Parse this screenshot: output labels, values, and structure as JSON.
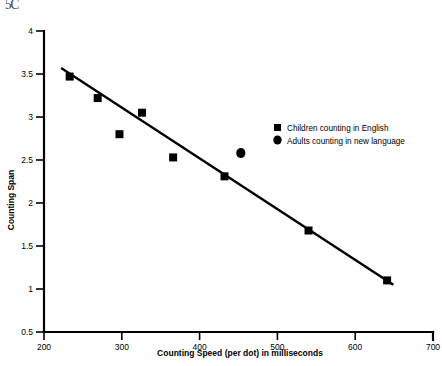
{
  "artifact": {
    "top_left_text": "5C",
    "top_left_sub": "."
  },
  "chart_data": {
    "type": "scatter",
    "title": "",
    "xlabel": "Counting Speed (per dot) in milliseconds",
    "ylabel": "Counting Span",
    "xlim": [
      200,
      700
    ],
    "ylim": [
      0.5,
      4
    ],
    "xticks": [
      200,
      300,
      400,
      500,
      600,
      700
    ],
    "xtick_labels": [
      "200",
      "300",
      "400",
      "500",
      "600",
      "700"
    ],
    "yticks": [
      0.5,
      1,
      1.5,
      2,
      2.5,
      3,
      3.5,
      4
    ],
    "ytick_labels": [
      "0.5",
      "1",
      "1.5",
      "2",
      "2.5",
      "3",
      "3.5",
      "4"
    ],
    "grid": false,
    "legend_position": "right-middle",
    "series": [
      {
        "name": "Children counting in English",
        "marker": "square",
        "color": "#000000",
        "points": [
          {
            "x": 233,
            "y": 3.47
          },
          {
            "x": 269,
            "y": 3.22
          },
          {
            "x": 297,
            "y": 2.8
          },
          {
            "x": 326,
            "y": 3.05
          },
          {
            "x": 366,
            "y": 2.53
          },
          {
            "x": 432,
            "y": 2.31
          },
          {
            "x": 540,
            "y": 1.68
          },
          {
            "x": 641,
            "y": 1.1
          }
        ]
      },
      {
        "name": "Adults counting in new language",
        "marker": "circle",
        "color": "#000000",
        "points": [
          {
            "x": 453,
            "y": 2.58
          }
        ]
      }
    ],
    "trendline": {
      "name": "linear fit",
      "x_start": 222,
      "y_start": 3.57,
      "x_end": 649,
      "y_end": 1.05
    }
  },
  "legend": {
    "items": [
      {
        "label": "Children counting in English",
        "marker": "square"
      },
      {
        "label": "Adults counting in new language",
        "marker": "circle"
      }
    ]
  }
}
